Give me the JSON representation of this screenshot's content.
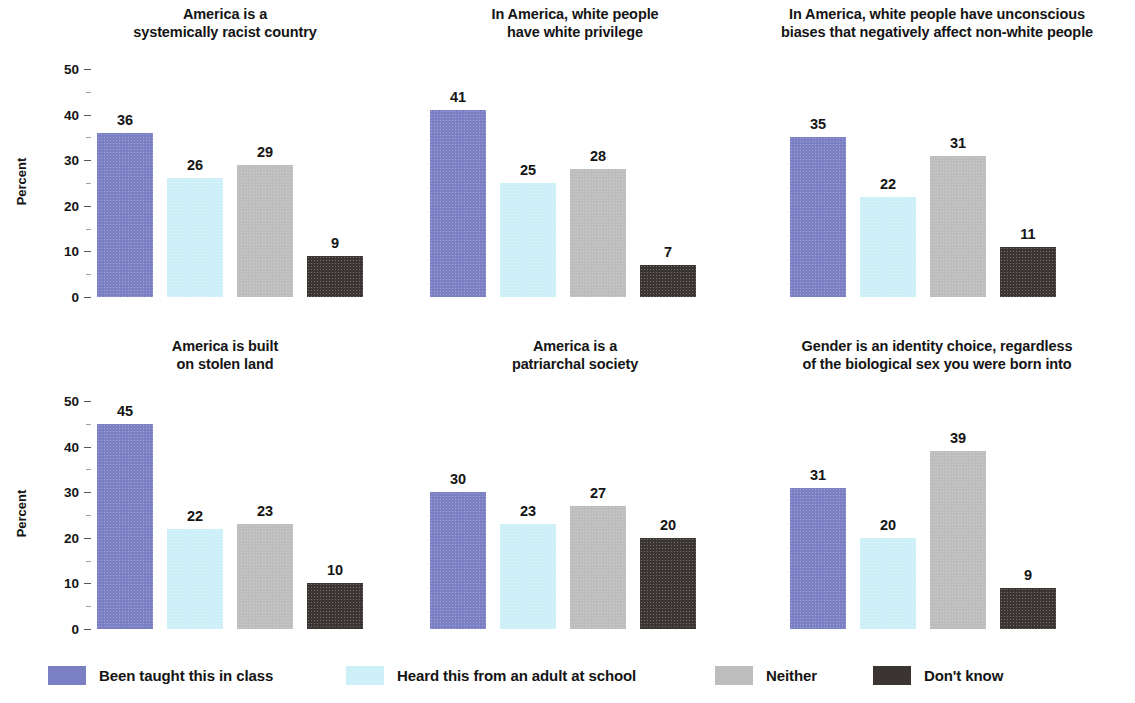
{
  "chart_data": {
    "type": "bar",
    "title": "",
    "subtitle": "",
    "xlabel": "",
    "ylabel": "Percent",
    "ylim": [
      0,
      50
    ],
    "ytick_labels": [
      "0",
      "10",
      "20",
      "30",
      "40",
      "50"
    ],
    "ytick_values": [
      0,
      10,
      20,
      30,
      40,
      50
    ],
    "minor_ticks": [
      5,
      15,
      25,
      35,
      45
    ],
    "grid": false,
    "legend_position": "bottom",
    "categories": [
      "Been taught this in class",
      "Heard this from an adult at school",
      "Neither",
      "Don't know"
    ],
    "series_colors": [
      "#7b7fc4",
      "#cdf0f8",
      "#bdbdbd",
      "#3a3432"
    ],
    "panels": [
      {
        "title": "America is a\nsystemically racist country",
        "values": [
          36,
          26,
          29,
          9
        ]
      },
      {
        "title": "In America, white people\nhave white privilege",
        "values": [
          41,
          25,
          28,
          7
        ]
      },
      {
        "title": "In America, white people have unconscious\nbiases that negatively affect non-white people",
        "values": [
          35,
          22,
          31,
          11
        ]
      },
      {
        "title": "America is built\non stolen land",
        "values": [
          45,
          22,
          23,
          10
        ]
      },
      {
        "title": "America is a\npatriarchal society",
        "values": [
          30,
          23,
          27,
          20
        ]
      },
      {
        "title": "Gender is an identity choice, regardless\nof the biological sex you were born into",
        "values": [
          31,
          20,
          39,
          9
        ]
      }
    ]
  },
  "legend": {
    "items": [
      {
        "label": "Been taught this in class",
        "color": "#7b7fc4"
      },
      {
        "label": "Heard this from an adult at school",
        "color": "#cdf0f8"
      },
      {
        "label": "Neither",
        "color": "#bdbdbd"
      },
      {
        "label": "Don't know",
        "color": "#3a3432"
      }
    ]
  }
}
